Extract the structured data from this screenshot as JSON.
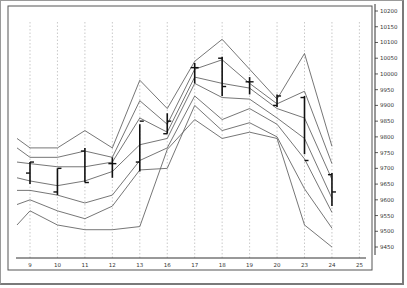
{
  "chart_data": {
    "type": "line",
    "subtype": "ohlc-with-bands",
    "title": "",
    "xlabel": "",
    "ylabel": "",
    "categories": [
      "9",
      "10",
      "11",
      "12",
      "13",
      "16",
      "17",
      "18",
      "19",
      "20",
      "23",
      "24",
      "25"
    ],
    "ylim": [
      9400,
      10230
    ],
    "yticks": [
      9450,
      9500,
      9550,
      9600,
      9650,
      9700,
      9750,
      9800,
      9850,
      9900,
      9950,
      10000,
      10050,
      10100,
      10150,
      10200
    ],
    "grid": "vertical-dotted",
    "y_axis_side": "right",
    "band_start": [
      9795,
      9765,
      9720,
      9670,
      9630,
      9585,
      9520
    ],
    "bands": [
      {
        "name": "band-1",
        "values": [
          9765,
          9765,
          9820,
          9765,
          9980,
          9890,
          10040,
          10110,
          10015,
          9920,
          10065,
          9770
        ]
      },
      {
        "name": "band-2",
        "values": [
          9735,
          9735,
          9755,
          9735,
          9915,
          9840,
          10015,
          10045,
          9970,
          9905,
          9945,
          9715
        ]
      },
      {
        "name": "band-3",
        "values": [
          9715,
          9705,
          9705,
          9720,
          9860,
          9815,
          9990,
          9970,
          9955,
          9890,
          9860,
          9665
        ]
      },
      {
        "name": "band-4",
        "values": [
          9660,
          9645,
          9660,
          9690,
          9775,
          9795,
          9970,
          9925,
          9920,
          9860,
          9795,
          9605
        ]
      },
      {
        "name": "band-5",
        "values": [
          9630,
          9615,
          9590,
          9615,
          9725,
          9765,
          9930,
          9855,
          9890,
          9840,
          9730,
          9560
        ]
      },
      {
        "name": "band-6",
        "values": [
          9600,
          9565,
          9540,
          9580,
          9695,
          9700,
          9900,
          9820,
          9845,
          9800,
          9635,
          9510
        ]
      },
      {
        "name": "band-7",
        "values": [
          9565,
          9520,
          9505,
          9505,
          9515,
          9760,
          9855,
          9795,
          9815,
          9795,
          9520,
          9450
        ]
      }
    ],
    "ohlc": [
      {
        "x": "9",
        "open": 9685,
        "high": 9720,
        "low": 9650,
        "close": 9720
      },
      {
        "x": "10",
        "open": 9625,
        "high": 9700,
        "low": 9615,
        "close": 9700
      },
      {
        "x": "11",
        "open": 9755,
        "high": 9765,
        "low": 9655,
        "close": 9655
      },
      {
        "x": "12",
        "open": 9715,
        "high": 9735,
        "low": 9670,
        "close": 9715
      },
      {
        "x": "13",
        "open": 9720,
        "high": 9840,
        "low": 9690,
        "close": 9850
      },
      {
        "x": "16",
        "open": 9810,
        "high": 9875,
        "low": 9810,
        "close": 9850
      },
      {
        "x": "17",
        "open": 10020,
        "high": 10035,
        "low": 9970,
        "close": 10020
      },
      {
        "x": "18",
        "open": 10050,
        "high": 10055,
        "low": 9930,
        "close": 9960
      },
      {
        "x": "19",
        "open": 9975,
        "high": 9990,
        "low": 9935,
        "close": 9975
      },
      {
        "x": "20",
        "open": 9900,
        "high": 9935,
        "low": 9895,
        "close": 9930
      },
      {
        "x": "23",
        "open": 9925,
        "high": 9930,
        "low": 9745,
        "close": 9725
      },
      {
        "x": "24",
        "open": 9680,
        "high": 9685,
        "low": 9580,
        "close": 9625
      }
    ]
  }
}
